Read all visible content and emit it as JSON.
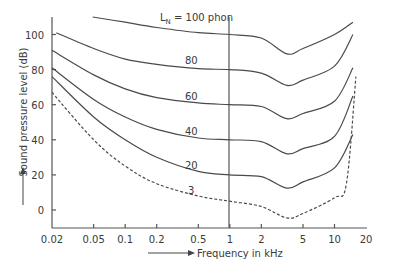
{
  "chart_data": {
    "type": "line",
    "title": "",
    "xlabel": "Frequency in kHz",
    "ylabel": "Sound pressure level (dB)",
    "x_scale": "log",
    "xlim": [
      0.02,
      20
    ],
    "ylim": [
      -10,
      110
    ],
    "x_ticks": [
      0.02,
      0.05,
      0.1,
      0.2,
      0.5,
      1,
      2,
      5,
      10,
      20
    ],
    "x_tick_labels": [
      "0.02",
      "0.05",
      "0.1",
      "0.2",
      "0.5",
      "1",
      "2",
      "5",
      "10",
      "20"
    ],
    "y_ticks": [
      0,
      20,
      40,
      60,
      80,
      100
    ],
    "y_tick_labels": [
      "0",
      "20",
      "40",
      "60",
      "80",
      "100"
    ],
    "grid": false,
    "reference_line": {
      "x": 1,
      "orientation": "vertical"
    },
    "legend": null,
    "annotations": [
      {
        "text": "L",
        "sub": "N",
        "rest": " = 100 phon",
        "curve": "100"
      },
      {
        "text": "80",
        "curve": "80"
      },
      {
        "text": "60",
        "curve": "60"
      },
      {
        "text": "40",
        "curve": "40"
      },
      {
        "text": "20",
        "curve": "20"
      },
      {
        "text": "3",
        "curve": "3"
      }
    ],
    "series": [
      {
        "name": "100 phon",
        "style": "solid",
        "x": [
          0.049,
          0.1,
          0.2,
          0.5,
          1,
          2,
          3.5,
          5,
          10,
          15
        ],
        "y": [
          110,
          107,
          104,
          101,
          100,
          98,
          89,
          92,
          100,
          107
        ]
      },
      {
        "name": "80 phon",
        "style": "solid",
        "x": [
          0.022,
          0.05,
          0.1,
          0.2,
          0.5,
          1,
          2,
          3.5,
          5,
          10,
          15
        ],
        "y": [
          101,
          92,
          86,
          83,
          80.5,
          80,
          78,
          71,
          74,
          82,
          100
        ]
      },
      {
        "name": "60 phon",
        "style": "solid",
        "x": [
          0.02,
          0.05,
          0.1,
          0.2,
          0.5,
          1,
          2,
          3.5,
          5,
          10,
          15
        ],
        "y": [
          91,
          77,
          69,
          64,
          61,
          60,
          59,
          52,
          55,
          62,
          81
        ]
      },
      {
        "name": "40 phon",
        "style": "solid",
        "x": [
          0.02,
          0.05,
          0.1,
          0.2,
          0.5,
          1,
          2,
          3.5,
          5,
          10,
          15
        ],
        "y": [
          81,
          63,
          53,
          46,
          41,
          40,
          39,
          32,
          35,
          42,
          65
        ]
      },
      {
        "name": "20 phon",
        "style": "solid",
        "x": [
          0.02,
          0.05,
          0.1,
          0.2,
          0.5,
          1,
          2,
          3.5,
          5,
          10,
          15
        ],
        "y": [
          76,
          53,
          40,
          30,
          22,
          20,
          19,
          12.5,
          16,
          24,
          43
        ]
      },
      {
        "name": "3 phon (threshold)",
        "style": "dashed",
        "x": [
          0.02,
          0.05,
          0.1,
          0.2,
          0.5,
          1,
          2,
          3.5,
          5,
          10,
          13,
          16
        ],
        "y": [
          67,
          40,
          25,
          15,
          8,
          5,
          2,
          -4.5,
          -2,
          7,
          15,
          76
        ]
      }
    ]
  },
  "labels": {
    "y_axis": "Sound pressure level (dB)",
    "x_axis": "Frequency in kHz",
    "curve_100_main": "L",
    "curve_100_sub": "N",
    "curve_100_rest": " = 100 phon",
    "curve_80": "80",
    "curve_60": "60",
    "curve_40": "40",
    "curve_20": "20",
    "curve_3": "3"
  }
}
